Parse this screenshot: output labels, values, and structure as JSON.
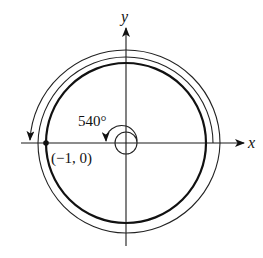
{
  "diagram": {
    "type": "angle-in-standard-position",
    "axes": {
      "x_label": "x",
      "y_label": "y"
    },
    "angle_label": "540°",
    "point_label": "(−1, 0)",
    "unit_circle": {
      "center": [
        126,
        143
      ],
      "radius": 80
    },
    "rotation_degrees": 540,
    "colors": {
      "stroke": "#111111",
      "background": "#ffffff"
    }
  }
}
